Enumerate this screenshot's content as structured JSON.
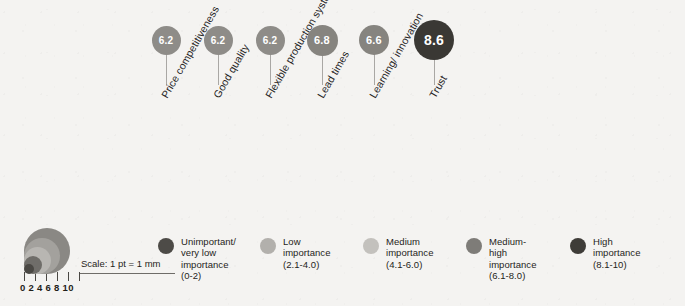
{
  "figure": {
    "background_color": "#f4f3f1",
    "scale_note": "Scale: 1 pt = 1 mm",
    "axis_tick_labels": "0 2 4 6 8 10"
  },
  "chart_data": {
    "type": "bar",
    "title": "",
    "subtitle": "",
    "xlabel": "",
    "ylabel": "Importance score",
    "ylim": [
      0,
      10
    ],
    "grid": false,
    "legend_position": "bottom",
    "annotation": "Scale: 1 pt = 1 mm",
    "categories": [
      "Price competitiveness",
      "Good quality",
      "Flexible production system",
      "Lead times",
      "Learning/ innovation",
      "Trust"
    ],
    "values": [
      6.2,
      6.2,
      6.2,
      6.8,
      6.6,
      8.6
    ],
    "value_labels": [
      "6.2",
      "6.2",
      "6.2",
      "6.8",
      "6.6",
      "8.6"
    ],
    "marker_colors": [
      "#8e8c88",
      "#8e8c88",
      "#8e8c88",
      "#86847f",
      "#86847f",
      "#3a3834"
    ],
    "marker_diameters_px": [
      29,
      29,
      29,
      31,
      30,
      40
    ],
    "marker_centers_x_px": [
      166,
      218,
      270,
      322,
      374,
      434
    ],
    "marker_center_y_px": 40,
    "stem_bottom_y_px": 86,
    "legend_bins": [
      {
        "label": "Unimportant/\nvery low\nimportance\n(0-2)",
        "range": "0-2",
        "color": "#4d4b47"
      },
      {
        "label": "Low importance\n(2.1-4.0)",
        "range": "2.1-4.0",
        "color": "#b2b0ac"
      },
      {
        "label": "Medium\nimportance\n(4.1-6.0)",
        "range": "4.1-6.0",
        "color": "#c3c1bd"
      },
      {
        "label": "Medium-high\nimportance\n(6.1-8.0)",
        "range": "6.1-8.0",
        "color": "#7e7c78"
      },
      {
        "label": "High  importance\n(8.1-10)",
        "range": "8.1-10",
        "color": "#3e3c38"
      }
    ]
  },
  "scale_key": {
    "caption": "Scale: 1 pt = 1 mm",
    "tick_values": [
      "0",
      "2",
      "4",
      "6",
      "8",
      "10"
    ],
    "tick_label_row": "0 2 4 6 8 10",
    "ring_colors": [
      "#8a8884",
      "#a3a19d",
      "#b8b6b2",
      "#6f6d69",
      "#4a4844"
    ]
  },
  "legend": {
    "items": [
      {
        "label": "Unimportant/\nvery low\nimportance\n(0-2)",
        "color": "#4d4b47",
        "x": 158
      },
      {
        "label": "Low importance\n(2.1-4.0)",
        "color": "#b2b0ac",
        "x": 260
      },
      {
        "label": "Medium\nimportance\n(4.1-6.0)",
        "color": "#c3c1bd",
        "x": 363
      },
      {
        "label": "Medium-high\nimportance\n(6.1-8.0)",
        "color": "#7e7c78",
        "x": 466
      },
      {
        "label": "High  importance\n(8.1-10)",
        "color": "#3e3c38",
        "x": 570
      }
    ]
  }
}
